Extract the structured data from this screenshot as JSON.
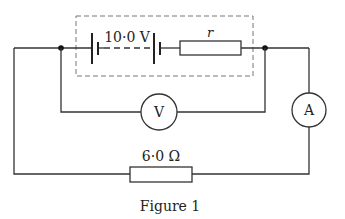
{
  "diagram": {
    "type": "circuit",
    "caption": "Figure 1",
    "battery": {
      "emf_label": "10·0 V",
      "internal_resistance_label": "r"
    },
    "voltmeter": {
      "label": "V"
    },
    "ammeter": {
      "label": "A"
    },
    "external_resistor": {
      "label": "6·0 Ω"
    },
    "colors": {
      "wire": "#333333",
      "dashed_box": "#777777",
      "background": "#ffffff"
    }
  }
}
